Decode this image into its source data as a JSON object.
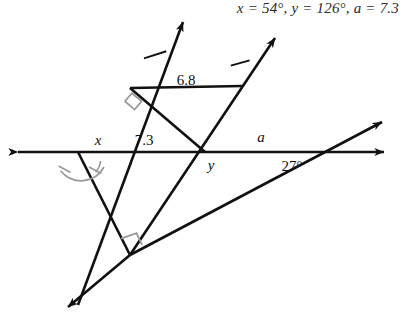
{
  "answer": {
    "text": "x = 54°, y = 126°, a = 7.3"
  },
  "diagram": {
    "type": "geometry-figure",
    "stroke_color": "#111111",
    "mark_color": "#9a9a9a",
    "labels": {
      "angle_x": "x",
      "angle_y": "y",
      "side_73": "7.3",
      "side_68": "6.8",
      "side_a": "a",
      "angle_27": "27°"
    },
    "given_values": {
      "segment_lower": 7.3,
      "segment_upper": 6.8,
      "known_angle_deg": 27
    },
    "solved_values": {
      "x_deg": 54,
      "y_deg": 126,
      "a_length": 7.3
    },
    "markers": {
      "right_angle_count": 2,
      "congruent_angle_arcs": 2,
      "parallel_tick_count": 2,
      "arrowhead_count": 6
    }
  }
}
